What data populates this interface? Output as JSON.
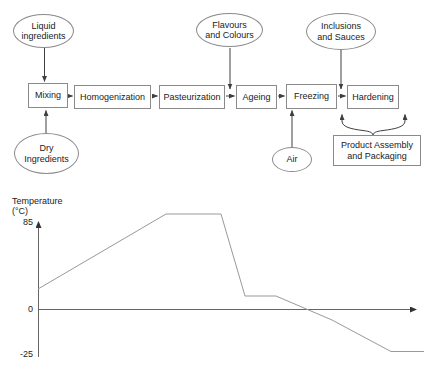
{
  "flowchart": {
    "ovals": [
      {
        "name": "liquid-ingredients",
        "label": "Liquid\ningredients"
      },
      {
        "name": "flavours-and-colours",
        "label": "Flavours\nand Colours"
      },
      {
        "name": "inclusions-and-sauces",
        "label": "Inclusions\nand Sauces"
      },
      {
        "name": "dry-ingredients",
        "label": "Dry\nIngredients"
      },
      {
        "name": "air",
        "label": "Air"
      }
    ],
    "steps": [
      {
        "name": "mixing",
        "label": "Mixing"
      },
      {
        "name": "homogenization",
        "label": "Homogenization"
      },
      {
        "name": "pasteurization",
        "label": "Pasteurization"
      },
      {
        "name": "ageing",
        "label": "Ageing"
      },
      {
        "name": "freezing",
        "label": "Freezing"
      },
      {
        "name": "hardening",
        "label": "Hardening"
      }
    ],
    "output_box": {
      "label": "Product Assembly\nand Packaging"
    }
  },
  "chart": {
    "ylabel_line1": "Temperature",
    "ylabel_line2": "(°C)",
    "tick_top": "85",
    "tick_zero": "0",
    "tick_bottom": "-25"
  },
  "chart_data": {
    "type": "line",
    "title": "",
    "xlabel": "",
    "ylabel": "Temperature (°C)",
    "yticks": [
      85,
      0,
      -25
    ],
    "ylim": [
      -25,
      85
    ],
    "x_axis_note": "time axis unlabeled, arrow to the right",
    "series": [
      {
        "name": "process-temperature-profile",
        "values_c": [
          20,
          85,
          85,
          13,
          13,
          -10,
          -25,
          -25
        ],
        "segments": "starts ~20, rises to 85 plateau (pasteurization), sharp drop to ~13 short hold, gradual decline crossing 0, down to -25 flat (hardening)"
      }
    ],
    "polyline_px": [
      [
        38,
        289
      ],
      [
        166,
        214
      ],
      [
        221,
        214
      ],
      [
        245,
        296
      ],
      [
        276,
        296
      ],
      [
        332,
        320
      ],
      [
        391,
        351.5
      ],
      [
        424,
        351.5
      ]
    ]
  },
  "colors": {
    "background": "#ffffff",
    "shape_border": "#8a8a8a",
    "text": "#222222",
    "arrow": "#3f3f3f",
    "axis": "#666666",
    "curve": "#999999"
  }
}
